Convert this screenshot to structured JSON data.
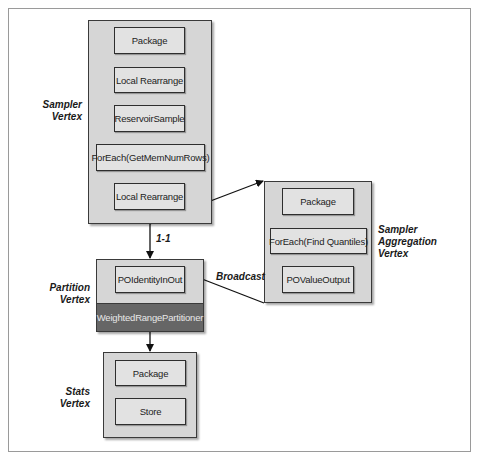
{
  "diagram": {
    "vertices": [
      {
        "id": "sampler",
        "label_line1": "Sampler",
        "label_line2": "Vertex",
        "operators": [
          "Package",
          "Local Rearrange",
          "ReservoirSample",
          "ForEach(GetMemNumRows)",
          "Local Rearrange"
        ]
      },
      {
        "id": "sampler-aggregation",
        "label_line1": "Sampler",
        "label_line2": "Aggregation",
        "label_line3": "Vertex",
        "operators": [
          "Package",
          "ForEach(Find Quantiles)",
          "POValueOutput"
        ]
      },
      {
        "id": "partition",
        "label_line1": "Partition",
        "label_line2": "Vertex",
        "operators": [
          "POIdentityInOut"
        ],
        "partitioner": "WeightedRangePartitioner"
      },
      {
        "id": "stats",
        "label_line1": "Stats",
        "label_line2": "Vertex",
        "operators": [
          "Package",
          "Store"
        ]
      }
    ],
    "edges": [
      {
        "from": "sampler",
        "to": "partition",
        "label": "1-1"
      },
      {
        "from": "sampler",
        "to": "sampler-aggregation",
        "label": ""
      },
      {
        "from": "sampler-aggregation",
        "to": "partition",
        "label": "Broadcast"
      },
      {
        "from": "partition",
        "to": "stats",
        "label": ""
      }
    ],
    "colors": {
      "vertex_fill": "#d6d6d6",
      "operator_fill": "#e2e2e2",
      "partitioner_fill": "#666666",
      "stroke": "#2e2e2e"
    }
  }
}
